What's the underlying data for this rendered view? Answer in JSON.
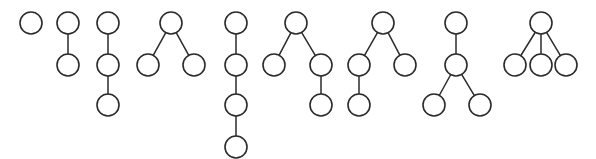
{
  "figure": {
    "background_color": "#ffffff",
    "node_stroke_color": "#2b2b2b",
    "node_fill_color": "#ffffff",
    "edge_stroke_color": "#2b2b2b",
    "node_radius": 11,
    "edge_stroke_width": 1.5,
    "tree_count": 9,
    "width": 596,
    "height": 159
  },
  "chart_data": {
    "type": "diagram",
    "xlabel": "",
    "ylabel": "",
    "grid": false,
    "legend": false,
    "node_radius": 11,
    "row_y": [
      23,
      65,
      105,
      147
    ],
    "trees": [
      {
        "id": "tree-1",
        "label": "single node",
        "node_count": 1,
        "edge_count": 0,
        "depth": 1,
        "nodes": [
          {
            "id": "n1",
            "x": 31,
            "y": 23,
            "level": 0,
            "role": "root"
          }
        ],
        "edges": []
      },
      {
        "id": "tree-2",
        "label": "path of two nodes",
        "node_count": 2,
        "edge_count": 1,
        "depth": 2,
        "nodes": [
          {
            "id": "n1",
            "x": 68,
            "y": 23,
            "level": 0,
            "role": "root"
          },
          {
            "id": "n2",
            "x": 68,
            "y": 65,
            "level": 1,
            "role": "child"
          }
        ],
        "edges": [
          {
            "from": "n1",
            "to": "n2"
          }
        ]
      },
      {
        "id": "tree-3",
        "label": "path of three nodes",
        "node_count": 3,
        "edge_count": 2,
        "depth": 3,
        "nodes": [
          {
            "id": "n1",
            "x": 108,
            "y": 23,
            "level": 0,
            "role": "root"
          },
          {
            "id": "n2",
            "x": 108,
            "y": 65,
            "level": 1,
            "role": "child"
          },
          {
            "id": "n3",
            "x": 108,
            "y": 105,
            "level": 2,
            "role": "child"
          }
        ],
        "edges": [
          {
            "from": "n1",
            "to": "n2"
          },
          {
            "from": "n2",
            "to": "n3"
          }
        ]
      },
      {
        "id": "tree-4",
        "label": "root with two children",
        "node_count": 3,
        "edge_count": 2,
        "depth": 2,
        "nodes": [
          {
            "id": "n1",
            "x": 171,
            "y": 23,
            "level": 0,
            "role": "root"
          },
          {
            "id": "n2",
            "x": 148,
            "y": 65,
            "level": 1,
            "role": "child"
          },
          {
            "id": "n3",
            "x": 194,
            "y": 65,
            "level": 1,
            "role": "child"
          }
        ],
        "edges": [
          {
            "from": "n1",
            "to": "n2"
          },
          {
            "from": "n1",
            "to": "n3"
          }
        ]
      },
      {
        "id": "tree-5",
        "label": "path of four nodes",
        "node_count": 4,
        "edge_count": 3,
        "depth": 4,
        "nodes": [
          {
            "id": "n1",
            "x": 236,
            "y": 23,
            "level": 0,
            "role": "root"
          },
          {
            "id": "n2",
            "x": 236,
            "y": 65,
            "level": 1,
            "role": "child"
          },
          {
            "id": "n3",
            "x": 236,
            "y": 105,
            "level": 2,
            "role": "child"
          },
          {
            "id": "n4",
            "x": 236,
            "y": 147,
            "level": 3,
            "role": "child"
          }
        ],
        "edges": [
          {
            "from": "n1",
            "to": "n2"
          },
          {
            "from": "n2",
            "to": "n3"
          },
          {
            "from": "n3",
            "to": "n4"
          }
        ]
      },
      {
        "id": "tree-6",
        "label": "root with two children, right child extended",
        "node_count": 4,
        "edge_count": 3,
        "depth": 3,
        "nodes": [
          {
            "id": "n1",
            "x": 296,
            "y": 23,
            "level": 0,
            "role": "root"
          },
          {
            "id": "n2",
            "x": 274,
            "y": 65,
            "level": 1,
            "role": "child"
          },
          {
            "id": "n3",
            "x": 321,
            "y": 65,
            "level": 1,
            "role": "child"
          },
          {
            "id": "n4",
            "x": 321,
            "y": 105,
            "level": 2,
            "role": "child"
          }
        ],
        "edges": [
          {
            "from": "n1",
            "to": "n2"
          },
          {
            "from": "n1",
            "to": "n3"
          },
          {
            "from": "n3",
            "to": "n4"
          }
        ]
      },
      {
        "id": "tree-7",
        "label": "root with two children, left child extended",
        "node_count": 4,
        "edge_count": 3,
        "depth": 3,
        "nodes": [
          {
            "id": "n1",
            "x": 383,
            "y": 23,
            "level": 0,
            "role": "root"
          },
          {
            "id": "n2",
            "x": 359,
            "y": 65,
            "level": 1,
            "role": "child"
          },
          {
            "id": "n3",
            "x": 405,
            "y": 65,
            "level": 1,
            "role": "child"
          },
          {
            "id": "n4",
            "x": 359,
            "y": 105,
            "level": 2,
            "role": "child"
          }
        ],
        "edges": [
          {
            "from": "n1",
            "to": "n2"
          },
          {
            "from": "n1",
            "to": "n3"
          },
          {
            "from": "n2",
            "to": "n4"
          }
        ]
      },
      {
        "id": "tree-8",
        "label": "root, middle node, then two children",
        "node_count": 4,
        "edge_count": 3,
        "depth": 3,
        "nodes": [
          {
            "id": "n1",
            "x": 456,
            "y": 23,
            "level": 0,
            "role": "root"
          },
          {
            "id": "n2",
            "x": 456,
            "y": 65,
            "level": 1,
            "role": "child"
          },
          {
            "id": "n3",
            "x": 434,
            "y": 105,
            "level": 2,
            "role": "child"
          },
          {
            "id": "n4",
            "x": 480,
            "y": 105,
            "level": 2,
            "role": "child"
          }
        ],
        "edges": [
          {
            "from": "n1",
            "to": "n2"
          },
          {
            "from": "n2",
            "to": "n3"
          },
          {
            "from": "n2",
            "to": "n4"
          }
        ]
      },
      {
        "id": "tree-9",
        "label": "root with three children",
        "node_count": 4,
        "edge_count": 3,
        "depth": 2,
        "nodes": [
          {
            "id": "n1",
            "x": 541,
            "y": 23,
            "level": 0,
            "role": "root"
          },
          {
            "id": "n2",
            "x": 515,
            "y": 65,
            "level": 1,
            "role": "child"
          },
          {
            "id": "n3",
            "x": 541,
            "y": 65,
            "level": 1,
            "role": "child"
          },
          {
            "id": "n4",
            "x": 566,
            "y": 65,
            "level": 1,
            "role": "child"
          }
        ],
        "edges": [
          {
            "from": "n1",
            "to": "n2"
          },
          {
            "from": "n1",
            "to": "n3"
          },
          {
            "from": "n1",
            "to": "n4"
          }
        ]
      }
    ]
  }
}
